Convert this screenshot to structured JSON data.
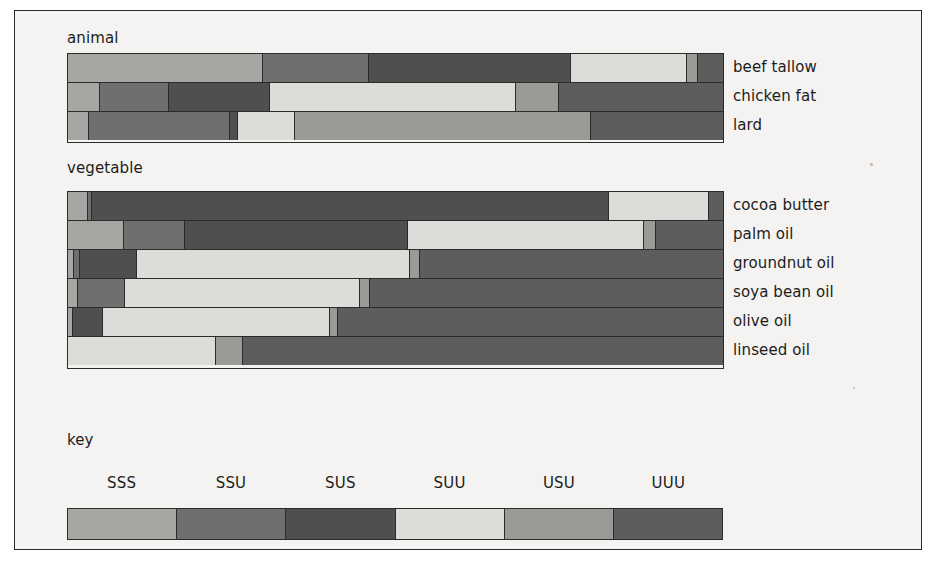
{
  "figure": {
    "background": "#f4f3f1",
    "border_color": "#2b2b2b"
  },
  "groups": [
    {
      "id": "animal",
      "label": "animal"
    },
    {
      "id": "vegetable",
      "label": "vegetable"
    }
  ],
  "key": {
    "title": "key"
  },
  "chart_data": {
    "type": "bar",
    "orientation": "horizontal",
    "stacked": true,
    "normalized": true,
    "title": "",
    "xlabel": "",
    "ylabel": "",
    "xlim": [
      0,
      100
    ],
    "grid": false,
    "legend_position": "bottom",
    "legend_title": "key",
    "categories_axis": "fatty acid triglyceride type",
    "series": [
      {
        "name": "SSS",
        "color": "#a8a6a2"
      },
      {
        "name": "SSU",
        "color": "#6f6f6f"
      },
      {
        "name": "SUS",
        "color": "#4f4f4f"
      },
      {
        "name": "SUU",
        "color": "#dddcd8"
      },
      {
        "name": "USU",
        "color": "#9b9a96"
      },
      {
        "name": "UUU",
        "color": "#5d5d5d"
      }
    ],
    "groups": [
      {
        "name": "animal",
        "items": [
          {
            "name": "beef tallow",
            "values": [
              29.7,
              16.2,
              30.9,
              17.7,
              1.7,
              3.8
            ]
          },
          {
            "name": "chicken fat",
            "values": [
              4.9,
              10.5,
              15.5,
              37.5,
              6.6,
              25.0
            ]
          },
          {
            "name": "lard",
            "values": [
              3.2,
              21.6,
              1.1,
              8.7,
              45.3,
              20.1
            ]
          }
        ]
      },
      {
        "name": "vegetable",
        "items": [
          {
            "name": "cocoa butter",
            "values": [
              3.1,
              0.6,
              78.9,
              15.3,
              0.0,
              2.1
            ]
          },
          {
            "name": "palm oil",
            "values": [
              8.6,
              9.2,
              34.1,
              36.1,
              1.8,
              10.2
            ]
          },
          {
            "name": "groundnut oil",
            "values": [
              0.9,
              0.9,
              8.7,
              41.7,
              1.5,
              46.3
            ]
          },
          {
            "name": "soya bean oil",
            "values": [
              1.5,
              7.2,
              0.0,
              35.9,
              1.5,
              53.9
            ]
          },
          {
            "name": "olive oil",
            "values": [
              0.8,
              0.0,
              4.5,
              34.7,
              1.2,
              58.8
            ]
          },
          {
            "name": "linseed oil",
            "values": [
              0.0,
              0.0,
              0.0,
              22.6,
              4.1,
              73.3
            ]
          }
        ]
      }
    ]
  }
}
